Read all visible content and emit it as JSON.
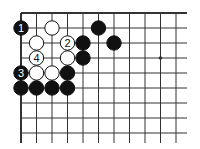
{
  "diagram": {
    "type": "go-board-fragment",
    "grid": {
      "columns": 11,
      "rows": 9,
      "origin_x": 21,
      "origin_y": 13,
      "spacing_x": 15.5,
      "spacing_y": 15,
      "extend_right": 11,
      "extend_bottom": 10,
      "edges": [
        "top",
        "left"
      ]
    },
    "colors": {
      "line": "#333333",
      "black_stone": "#111111",
      "white_stone": "#ffffff"
    },
    "star_points": [
      {
        "col": 9,
        "row": 3
      }
    ],
    "stones": [
      {
        "col": 0,
        "row": 1,
        "color": "black",
        "label": "1"
      },
      {
        "col": 2,
        "row": 1,
        "color": "white",
        "label": ""
      },
      {
        "col": 5,
        "row": 1,
        "color": "black",
        "label": ""
      },
      {
        "col": 1,
        "row": 2,
        "color": "white",
        "label": ""
      },
      {
        "col": 3,
        "row": 2,
        "color": "white",
        "label": "2"
      },
      {
        "col": 4,
        "row": 2,
        "color": "black",
        "label": ""
      },
      {
        "col": 6,
        "row": 2,
        "color": "black",
        "label": ""
      },
      {
        "col": 1,
        "row": 3,
        "color": "white",
        "label": "4"
      },
      {
        "col": 3,
        "row": 3,
        "color": "white",
        "label": ""
      },
      {
        "col": 4,
        "row": 3,
        "color": "black",
        "label": ""
      },
      {
        "col": 0,
        "row": 4,
        "color": "black",
        "label": "3"
      },
      {
        "col": 1,
        "row": 4,
        "color": "white",
        "label": ""
      },
      {
        "col": 2,
        "row": 4,
        "color": "white",
        "label": ""
      },
      {
        "col": 3,
        "row": 4,
        "color": "black",
        "label": ""
      },
      {
        "col": 0,
        "row": 5,
        "color": "black",
        "label": ""
      },
      {
        "col": 1,
        "row": 5,
        "color": "black",
        "label": ""
      },
      {
        "col": 2,
        "row": 5,
        "color": "black",
        "label": ""
      },
      {
        "col": 3,
        "row": 5,
        "color": "black",
        "label": ""
      }
    ]
  }
}
